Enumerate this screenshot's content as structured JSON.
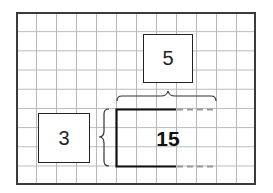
{
  "diagram": {
    "type": "area-model-multiplication",
    "factor_top": "5",
    "factor_left": "3",
    "product": "15",
    "grid": {
      "columns": 12,
      "rows": 9
    },
    "colors": {
      "grid_line": "#b8b8b8",
      "border": "#3a3a3a",
      "rectangle": "#111111",
      "dashed_extension": "#999999"
    }
  }
}
